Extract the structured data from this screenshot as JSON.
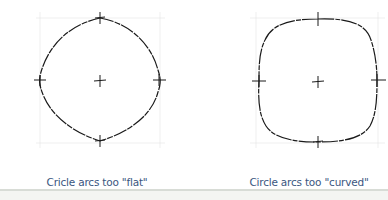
{
  "figures": [
    {
      "id": "flat",
      "caption": "Cricle arcs too \"flat\"",
      "shape": "circle-with-flat-arcs (diamond-like)"
    },
    {
      "id": "curved",
      "caption": "Circle arcs too \"curved\"",
      "shape": "circle-with-overly-curved-arcs (squircle-like)"
    }
  ],
  "colors": {
    "stroke": "#1a1a1a",
    "guide": "#e6e6e6",
    "caption": "#3a5680"
  }
}
